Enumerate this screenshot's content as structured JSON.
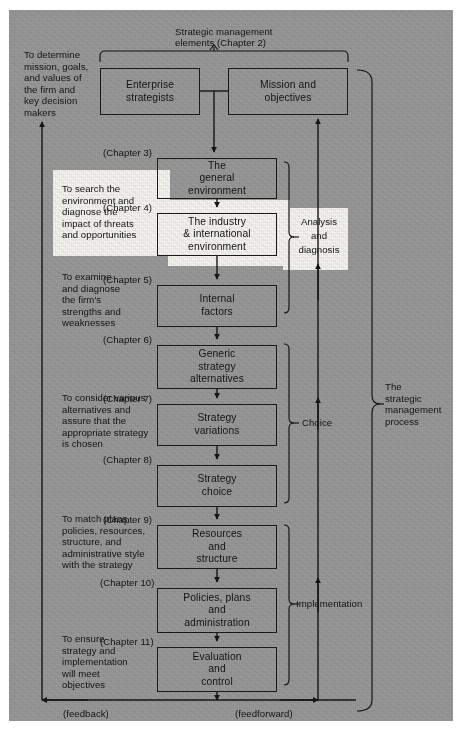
{
  "diagram": {
    "top_label_line1": "Strategic management",
    "top_label_line2": "elements (Chapter 2)",
    "outer_bracket_label": "The\nstrategic\nmanagement\nprocess",
    "feedback_label": "(feedback)",
    "feedforward_label": "(feedforward)"
  },
  "boxes": [
    {
      "id": "enterprise-strategists",
      "lines": "Enterprise\nstrategists",
      "chapter": ""
    },
    {
      "id": "mission-objectives",
      "lines": "Mission and\nobjectives",
      "chapter": ""
    },
    {
      "id": "general-environment",
      "lines": "The\ngeneral\nenvironment",
      "chapter": "(Chapter 3)"
    },
    {
      "id": "industry-international-environment",
      "lines": "The industry\n& international\nenvironment",
      "chapter": "(Chapter 4)"
    },
    {
      "id": "internal-factors",
      "lines": "Internal\nfactors",
      "chapter": "(Chapter 5)"
    },
    {
      "id": "generic-strategy-alternatives",
      "lines": "Generic\nstrategy\nalternatives",
      "chapter": "(Chapter 6)"
    },
    {
      "id": "strategy-variations",
      "lines": "Strategy\nvariations",
      "chapter": "(Chapter 7)"
    },
    {
      "id": "strategy-choice",
      "lines": "Strategy\nchoice",
      "chapter": "(Chapter 8)"
    },
    {
      "id": "resources-structure",
      "lines": "Resources\nand\nstructure",
      "chapter": "(Chapter 9)"
    },
    {
      "id": "policies-plans-administration",
      "lines": "Policies, plans\nand\nadministration",
      "chapter": "(Chapter 10)"
    },
    {
      "id": "evaluation-control",
      "lines": "Evaluation\nand\ncontrol",
      "chapter": "(Chapter 11)"
    }
  ],
  "purpose_notes": [
    {
      "id": "determine-mission",
      "text": "To determine\nmission, goals,\nand values of\nthe firm and\nkey decision\nmakers"
    },
    {
      "id": "search-environment",
      "text": "To search the\nenvironment and\ndiagnose the\nimpact of threats\nand opportunities"
    },
    {
      "id": "examine-strengths",
      "text": "To examine\nand diagnose\nthe firm's\nstrengths and\nweaknesses"
    },
    {
      "id": "consider-alternatives",
      "text": "To consider various\nalternatives and\nassure that the\nappropriate strategy\nis chosen"
    },
    {
      "id": "match-plans",
      "text": "To match plans,\npolicies, resources,\nstructure, and\nadministrative style\nwith the strategy"
    },
    {
      "id": "ensure-strategy",
      "text": "To ensure\nstrategy and\nimplementation\nwill meet\nobjectives"
    }
  ],
  "phase_brackets": [
    {
      "id": "analysis-diagnosis",
      "label": "Analysis\nand\ndiagnosis"
    },
    {
      "id": "choice",
      "label": "Choice"
    },
    {
      "id": "implementation",
      "label": "Implementation"
    }
  ],
  "colors": {
    "paper": "#9a9a9a",
    "ink": "#161616",
    "highlight": "#f7f6f2"
  }
}
